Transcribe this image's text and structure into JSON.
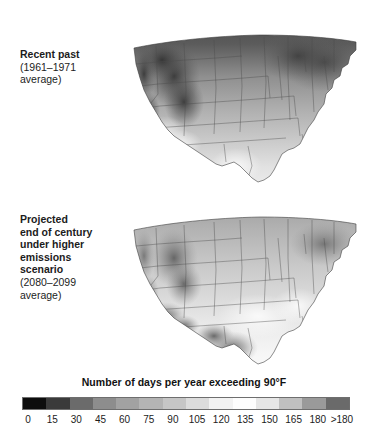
{
  "panels": [
    {
      "id": "recent-past",
      "title_lines": [
        "Recent past"
      ],
      "sub_lines": [
        "(1961–1971",
        "average)"
      ]
    },
    {
      "id": "projected-end-century",
      "title_lines": [
        "Projected",
        "end of century",
        "under higher",
        "emissions",
        "scenario"
      ],
      "sub_lines": [
        "(2080–2099",
        "average)"
      ]
    }
  ],
  "legend": {
    "title": "Number of days per year exceeding 90°F",
    "ticks": [
      "0",
      "15",
      "30",
      "45",
      "60",
      "75",
      "90",
      "105",
      "120",
      "135",
      "150",
      "165",
      "180",
      ">180"
    ],
    "colors": [
      "#0d0d0d",
      "#3a3a3a",
      "#6b6b6b",
      "#8d8d8d",
      "#a2a2a2",
      "#b4b4b4",
      "#c6c6c6",
      "#dcdcdc",
      "#f2f2f2",
      "#fdfdfd",
      "#e6e6e6",
      "#c0c0c0",
      "#9a9a9a",
      "#6a6a6a"
    ]
  },
  "chart_data": {
    "type": "heatmap",
    "title": "Number of days per year exceeding 90°F",
    "variable": "days per year exceeding 90°F",
    "region": "Contiguous United States",
    "grid": false,
    "legend_position": "bottom",
    "colorbar": {
      "label": "Number of days per year exceeding 90°F",
      "tick_values": [
        0,
        15,
        30,
        45,
        60,
        75,
        90,
        105,
        120,
        135,
        150,
        165,
        180
      ],
      "tick_labels": [
        "0",
        "15",
        "30",
        "45",
        "60",
        "75",
        "90",
        "105",
        "120",
        "135",
        "150",
        "165",
        "180",
        ">180"
      ],
      "bands": 14,
      "range": [
        0,
        180
      ],
      "overflow_label": ">180"
    },
    "panels": [
      {
        "name": "Recent past (1961–1971 average)",
        "period": "1961–1971",
        "scenario": "observed",
        "regions": [
          {
            "region": "Northern Plains / Upper Midwest",
            "value": 15
          },
          {
            "region": "Northeast / New England",
            "value": 5
          },
          {
            "region": "Pacific Northwest",
            "value": 10
          },
          {
            "region": "Northern Rockies",
            "value": 10
          },
          {
            "region": "Great Lakes",
            "value": 10
          },
          {
            "region": "Ohio Valley",
            "value": 30
          },
          {
            "region": "Mid-Atlantic",
            "value": 30
          },
          {
            "region": "Central Plains",
            "value": 60
          },
          {
            "region": "Southeast",
            "value": 60
          },
          {
            "region": "Florida peninsula",
            "value": 90
          },
          {
            "region": "Gulf Coast",
            "value": 75
          },
          {
            "region": "Southern Texas",
            "value": 105
          },
          {
            "region": "Desert Southwest / Lower Colorado",
            "value": 135
          },
          {
            "region": "Intermountain West high elevation",
            "value": 10
          }
        ]
      },
      {
        "name": "Projected end of century under higher emissions scenario (2080–2099 average)",
        "period": "2080–2099",
        "scenario": "higher emissions",
        "regions": [
          {
            "region": "Northern Plains / Upper Midwest",
            "value": 60
          },
          {
            "region": "Northeast / New England",
            "value": 45
          },
          {
            "region": "Pacific Northwest",
            "value": 30
          },
          {
            "region": "Northern Rockies",
            "value": 45
          },
          {
            "region": "Great Lakes",
            "value": 60
          },
          {
            "region": "Ohio Valley",
            "value": 90
          },
          {
            "region": "Mid-Atlantic",
            "value": 90
          },
          {
            "region": "Central Plains",
            "value": 120
          },
          {
            "region": "Southeast",
            "value": 135
          },
          {
            "region": "Florida peninsula",
            "value": 150
          },
          {
            "region": "Gulf Coast",
            "value": 150
          },
          {
            "region": "Southern Texas",
            "value": 195
          },
          {
            "region": "Desert Southwest / Lower Colorado",
            "value": 195
          },
          {
            "region": "Intermountain West high elevation",
            "value": 45
          }
        ]
      }
    ]
  }
}
